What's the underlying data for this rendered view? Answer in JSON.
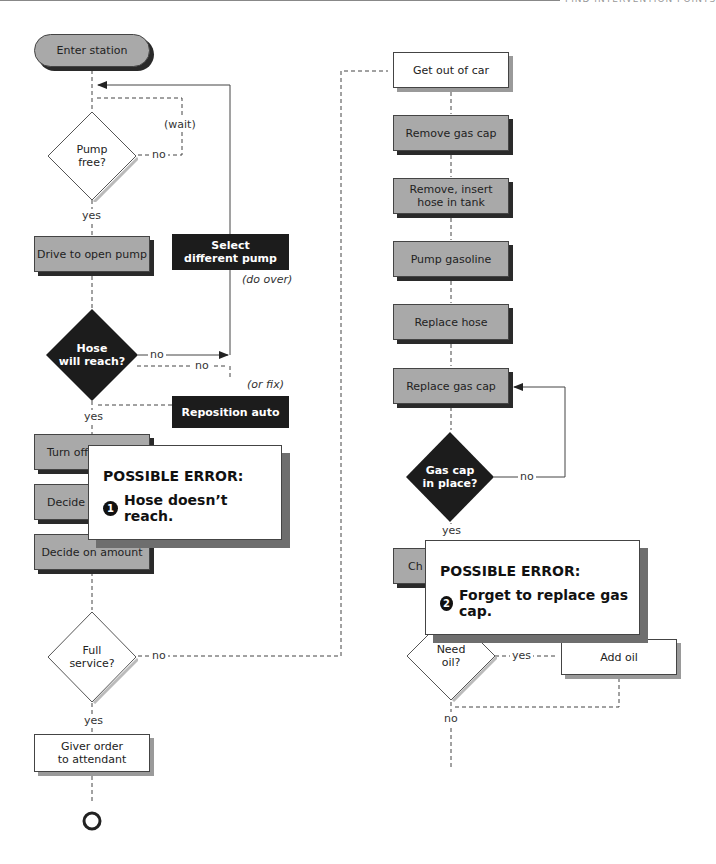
{
  "header": {
    "section_title": "FIND INTERVENTION POINTS"
  },
  "left_column": {
    "start": "Enter station",
    "pump_free": {
      "label": "Pump\nfree?",
      "line1": "Pump",
      "line2": "free?",
      "no": "no",
      "wait": "(wait)",
      "yes": "yes"
    },
    "drive_to_pump": "Drive to open pump",
    "select_different_pump": {
      "line1": "Select",
      "line2": "different pump",
      "note": "(do over)"
    },
    "hose_will_reach": {
      "line1": "Hose",
      "line2": "will reach?",
      "no1": "no",
      "no2": "no",
      "yes": "yes"
    },
    "reposition_auto": {
      "label": "Reposition auto",
      "note": "(or fix)"
    },
    "turn_off": "Turn off",
    "decide": "Decide",
    "decide_amount": "Decide on amount",
    "full_service": {
      "line1": "Full",
      "line2": "service?",
      "no": "no",
      "yes": "yes"
    },
    "give_order": {
      "line1": "Giver order",
      "line2": "to attendant"
    }
  },
  "right_column": {
    "get_out": "Get out of car",
    "remove_cap": "Remove gas cap",
    "insert_hose": {
      "line1": "Remove, insert",
      "line2": "hose in tank"
    },
    "pump_gas": "Pump gasoline",
    "replace_hose": "Replace hose",
    "replace_cap": "Replace gas cap",
    "cap_in_place": {
      "line1": "Gas cap",
      "line2": "in place?",
      "no": "no",
      "yes": "yes"
    },
    "check": "Ch",
    "need_oil": {
      "line1": "Need",
      "line2": "oil?",
      "yes": "yes",
      "no": "no"
    },
    "add_oil": "Add oil"
  },
  "errors": [
    {
      "title": "POSSIBLE ERROR:",
      "number": "1",
      "text": "Hose doesn’t reach."
    },
    {
      "title": "POSSIBLE ERROR:",
      "number": "2",
      "text": "Forget to replace gas cap."
    }
  ],
  "colors": {
    "gray_box": "#a9a9a9",
    "black_box": "#1c1c1c",
    "shadow_dark": "#2a2a2a",
    "error_shadow": "#6e6e6e"
  }
}
